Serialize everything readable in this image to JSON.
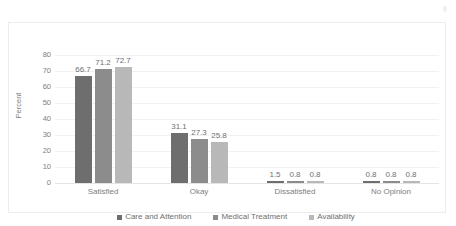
{
  "chart_data": {
    "type": "bar",
    "title": "",
    "xlabel": "",
    "ylabel": "Percent",
    "ylim": [
      0,
      80
    ],
    "yticks": [
      80,
      70,
      60,
      50,
      40,
      30,
      20,
      10,
      0
    ],
    "grid": true,
    "legend_position": "bottom",
    "categories": [
      "Satisfied",
      "Okay",
      "Dissatisfied",
      "No Opinion"
    ],
    "series": [
      {
        "name": "Care and Attention",
        "color": "#6e6e6e",
        "values": [
          66.7,
          31.1,
          1.5,
          0.8
        ],
        "labels": [
          "66.7",
          "31.1",
          "1.5",
          "0.8"
        ]
      },
      {
        "name": "Medical Treatment",
        "color": "#8c8c8c",
        "values": [
          71.2,
          27.3,
          0.8,
          0.8
        ],
        "labels": [
          "71.2",
          "27.3",
          "0.8",
          "0.8"
        ]
      },
      {
        "name": "Availability",
        "color": "#b8b8b8",
        "values": [
          72.7,
          25.8,
          0.8,
          0.8
        ],
        "labels": [
          "72.7",
          "25.8",
          "0.8",
          "0.8"
        ]
      }
    ]
  },
  "axis": {
    "y_title": "Percent",
    "tick_labels": [
      "80",
      "70",
      "60",
      "50",
      "40",
      "30",
      "20",
      "10",
      "0"
    ]
  },
  "categories": {
    "items": [
      {
        "label": "Satisfied"
      },
      {
        "label": "Okay"
      },
      {
        "label": "Dissatisfied"
      },
      {
        "label": "No Opinion"
      }
    ]
  },
  "legend": {
    "items": [
      {
        "label": "Care and Attention",
        "color": "#6e6e6e"
      },
      {
        "label": "Medical Treatment",
        "color": "#8c8c8c"
      },
      {
        "label": "Availability",
        "color": "#b8b8b8"
      }
    ]
  }
}
